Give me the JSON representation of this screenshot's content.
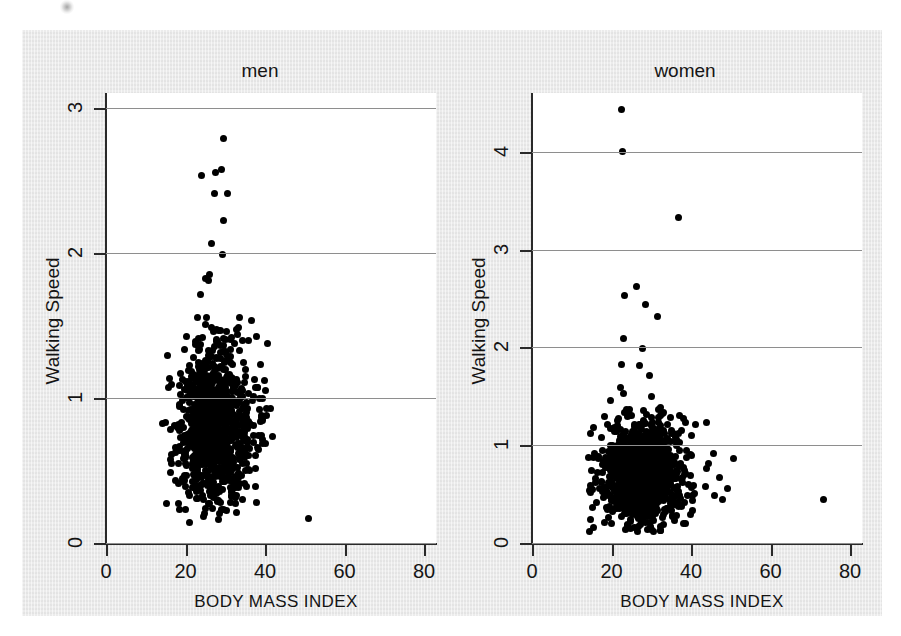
{
  "figure": {
    "background_color": "#eaeaea",
    "plot_background_color": "#ffffff",
    "marker_color": "#000000",
    "grid_color": "#8e8e8e",
    "axis_color": "#2a2a2a"
  },
  "chart_data": [
    {
      "type": "scatter",
      "title": "men",
      "xlabel": "BODY MASS INDEX",
      "ylabel": "Walking Speed",
      "xlim": [
        0,
        83
      ],
      "ylim": [
        0,
        3.1
      ],
      "xticks": [
        0,
        20,
        40,
        60,
        80
      ],
      "xticklabels": [
        "0",
        "20",
        "40",
        "60",
        "80"
      ],
      "yticks": [
        0,
        1,
        2,
        3
      ],
      "yticklabels": [
        "0",
        "1",
        "2",
        "3"
      ],
      "grid": "horizontal",
      "legend": "none",
      "n_points": 1100,
      "cluster": {
        "x_mean": 26.5,
        "x_sd": 4.2,
        "x_min": 14,
        "x_max": 42,
        "y_mean": 0.78,
        "y_sd": 0.26,
        "y_min": 0.13,
        "y_max": 1.75
      },
      "outliers": [
        {
          "x": 29.5,
          "y": 2.79
        },
        {
          "x": 24.0,
          "y": 2.53
        },
        {
          "x": 27.6,
          "y": 2.55
        },
        {
          "x": 29.1,
          "y": 2.57
        },
        {
          "x": 27.2,
          "y": 2.41
        },
        {
          "x": 30.6,
          "y": 2.41
        },
        {
          "x": 29.6,
          "y": 2.22
        },
        {
          "x": 26.5,
          "y": 2.06
        },
        {
          "x": 29.4,
          "y": 1.99
        },
        {
          "x": 26.1,
          "y": 1.85
        },
        {
          "x": 24.9,
          "y": 1.82
        },
        {
          "x": 25.7,
          "y": 1.81
        },
        {
          "x": 36.5,
          "y": 1.53
        },
        {
          "x": 37.8,
          "y": 1.42
        },
        {
          "x": 38.9,
          "y": 1.23
        },
        {
          "x": 40.2,
          "y": 1.05
        },
        {
          "x": 38.6,
          "y": 0.92
        },
        {
          "x": 39.4,
          "y": 0.86
        },
        {
          "x": 37.0,
          "y": 0.81
        },
        {
          "x": 39.1,
          "y": 0.74
        },
        {
          "x": 15.4,
          "y": 1.29
        },
        {
          "x": 14.9,
          "y": 0.83
        },
        {
          "x": 15.2,
          "y": 0.27
        },
        {
          "x": 50.9,
          "y": 0.17
        }
      ]
    },
    {
      "type": "scatter",
      "title": "women",
      "xlabel": "BODY MASS INDEX",
      "ylabel": "Walking Speed",
      "xlim": [
        0,
        83
      ],
      "ylim": [
        0,
        4.6
      ],
      "xticks": [
        0,
        20,
        40,
        60,
        80
      ],
      "xticklabels": [
        "0",
        "20",
        "40",
        "60",
        "80"
      ],
      "yticks": [
        0,
        1,
        2,
        3,
        4
      ],
      "yticklabels": [
        "0",
        "1",
        "2",
        "3",
        "4"
      ],
      "grid": "horizontal",
      "legend": "none",
      "n_points": 1200,
      "cluster": {
        "x_mean": 27.0,
        "x_sd": 4.6,
        "x_min": 14,
        "x_max": 45,
        "y_mean": 0.69,
        "y_sd": 0.25,
        "y_min": 0.1,
        "y_max": 1.62
      },
      "outliers": [
        {
          "x": 22.6,
          "y": 4.43
        },
        {
          "x": 22.8,
          "y": 4.0
        },
        {
          "x": 36.8,
          "y": 3.33
        },
        {
          "x": 26.3,
          "y": 2.62
        },
        {
          "x": 23.3,
          "y": 2.53
        },
        {
          "x": 28.5,
          "y": 2.44
        },
        {
          "x": 31.6,
          "y": 2.32
        },
        {
          "x": 23.0,
          "y": 2.09
        },
        {
          "x": 27.9,
          "y": 1.99
        },
        {
          "x": 22.6,
          "y": 1.82
        },
        {
          "x": 27.0,
          "y": 1.81
        },
        {
          "x": 29.5,
          "y": 1.71
        },
        {
          "x": 43.8,
          "y": 1.23
        },
        {
          "x": 41.2,
          "y": 1.21
        },
        {
          "x": 40.0,
          "y": 1.1
        },
        {
          "x": 45.6,
          "y": 0.92
        },
        {
          "x": 50.8,
          "y": 0.86
        },
        {
          "x": 44.0,
          "y": 0.76
        },
        {
          "x": 47.2,
          "y": 0.67
        },
        {
          "x": 49.2,
          "y": 0.56
        },
        {
          "x": 46.0,
          "y": 0.49
        },
        {
          "x": 48.0,
          "y": 0.44
        },
        {
          "x": 73.2,
          "y": 0.44
        },
        {
          "x": 15.0,
          "y": 0.74
        },
        {
          "x": 14.6,
          "y": 0.55
        },
        {
          "x": 15.1,
          "y": 0.36
        }
      ]
    }
  ]
}
